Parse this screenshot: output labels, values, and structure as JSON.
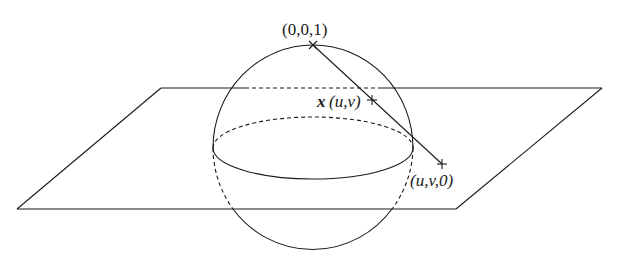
{
  "figure": {
    "labels": {
      "north_pole": "(0,0,1)",
      "sphere_point_vector": "x",
      "sphere_point_args": "(u,v)",
      "plane_point": "(u,v,0)"
    },
    "colors": {
      "stroke": "#1a1a1a",
      "background": "#ffffff"
    }
  }
}
